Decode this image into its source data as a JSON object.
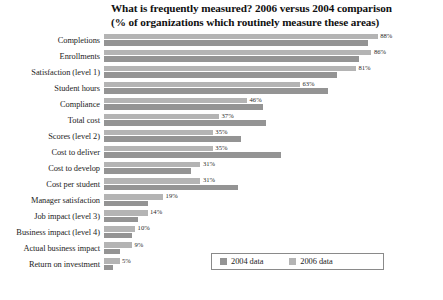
{
  "chart_data": {
    "type": "bar",
    "orientation": "horizontal",
    "title": "What is frequently measured? 2006 versus 2004 comparison",
    "subtitle": "(% of organizations which routinely measure these areas)",
    "title_lines": [
      "What is frequently measured? 2006 versus 2004 comparison",
      "(% of organizations which routinely measure these areas)"
    ],
    "xlabel": "",
    "ylabel": "",
    "xlim": [
      0,
      100
    ],
    "grid": false,
    "legend_position": "bottom-right",
    "categories": [
      "Completions",
      "Enrollments",
      "Satisfaction (level 1)",
      "Student hours",
      "Compliance",
      "Total cost",
      "Scores (level 2)",
      "Cost to deliver",
      "Cost to develop",
      "Cost per student",
      "Manager satisfaction",
      "Job impact (level 3)",
      "Business impact (level 4)",
      "Actual business impact",
      "Return on investment"
    ],
    "series": [
      {
        "name": "2006 data",
        "color": "#b4b4b4",
        "values": [
          88,
          86,
          81,
          63,
          46,
          37,
          35,
          35,
          31,
          31,
          19,
          14,
          10,
          9,
          5
        ]
      },
      {
        "name": "2004 data",
        "color": "#949494",
        "values": [
          85,
          82,
          75,
          72,
          51,
          52,
          44,
          57,
          28,
          43,
          14,
          11,
          9,
          5,
          3
        ]
      }
    ],
    "value_labels": [
      "88%",
      "86%",
      "81%",
      "63%",
      "46%",
      "37%",
      "35%",
      "35%",
      "31%",
      "31%",
      "19%",
      "14%",
      "10%",
      "9%",
      "5%"
    ]
  },
  "legend": {
    "entries": [
      {
        "label": "2004 data",
        "swatch": "swatch-2004-icon"
      },
      {
        "label": "2006 data",
        "swatch": "swatch-2006-icon"
      }
    ]
  }
}
